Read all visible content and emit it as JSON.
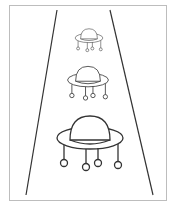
{
  "illustration": {
    "subject": "three flying saucers in a light beam",
    "frame": {
      "x": 9,
      "y": 5,
      "w": 158,
      "h": 196,
      "stroke": "#bdbdbd"
    },
    "beam": {
      "left": {
        "x1": 57,
        "y1": 10,
        "x2": 26,
        "y2": 195
      },
      "right": {
        "x1": 110,
        "y1": 10,
        "x2": 153,
        "y2": 195
      },
      "stroke": "#333333"
    },
    "saucers": [
      {
        "name": "small",
        "cx": 89,
        "cy": 36,
        "scale": 0.42
      },
      {
        "name": "medium",
        "cx": 89,
        "cy": 78,
        "scale": 0.62
      },
      {
        "name": "large",
        "cx": 89,
        "cy": 138,
        "scale": 1.0
      }
    ],
    "stroke_color": "#333333"
  }
}
